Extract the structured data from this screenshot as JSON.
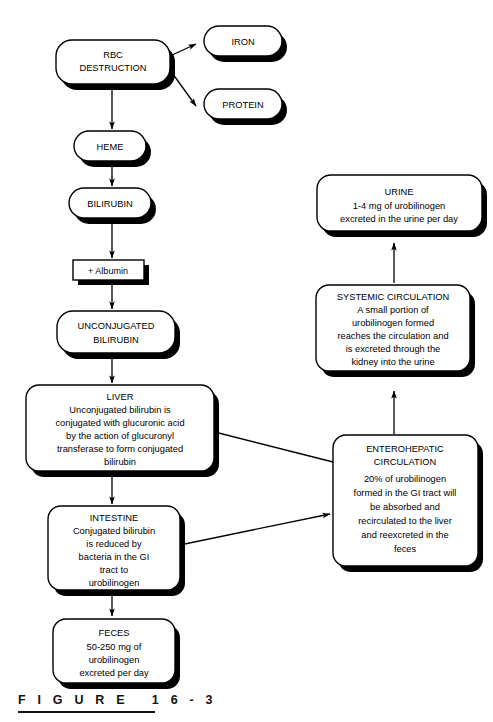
{
  "figure": {
    "caption": "F I G U R E   1 6 - 3",
    "caption_label": "FIGURE 16-3"
  },
  "nodes": {
    "rbc_destruction": {
      "line1": "RBC",
      "line2": "DESTRUCTION"
    },
    "iron": {
      "line1": "IRON"
    },
    "protein": {
      "line1": "PROTEIN"
    },
    "heme": {
      "line1": "HEME"
    },
    "bilirubin": {
      "line1": "BILIRUBIN"
    },
    "albumin": {
      "line1": "+ Albumin"
    },
    "unconjugated_bilirubin": {
      "line1": "UNCONJUGATED",
      "line2": "BILIRUBIN"
    },
    "liver": {
      "title": "LIVER",
      "line1": "Unconjugated bilirubin is",
      "line2": "conjugated with glucuronic acid",
      "line3": "by the action of glucuronyl",
      "line4": "transferase to form conjugated",
      "line5": "bilirubin"
    },
    "intestine": {
      "title": "INTESTINE",
      "line1": "Conjugated bilirubin",
      "line2": "is reduced by",
      "line3": "bacteria in the GI",
      "line4": "tract to",
      "line5": "urobilinogen"
    },
    "feces": {
      "title": "FECES",
      "line1": "50-250 mg of",
      "line2": "urobilinogen",
      "line3": "excreted per day"
    },
    "urine": {
      "title": "URINE",
      "line1": "1-4 mg of urobilinogen",
      "line2": "excreted in the urine per day"
    },
    "systemic_circulation": {
      "title": "SYSTEMIC CIRCULATION",
      "line1": "A small portion of",
      "line2": "urobilinogen formed",
      "line3": "reaches the circulation and",
      "line4": "is excreted through the",
      "line5": "kidney into the urine"
    },
    "enterohepatic_circulation": {
      "title1": "ENTEROHEPATIC",
      "title2": "CIRCULATION",
      "line1": "20% of urobilinogen",
      "line2": "formed in the GI tract will",
      "line3": "be absorbed and",
      "line4": "recirculated to the liver",
      "line5": "and reexcreted in the",
      "line6": "feces"
    }
  },
  "colors": {
    "ink": "#000000",
    "paper": "#ffffff"
  }
}
